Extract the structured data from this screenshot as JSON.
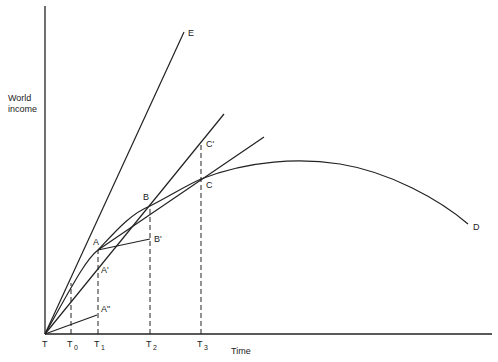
{
  "diagram": {
    "y_axis_label_line1": "World",
    "y_axis_label_line2": "income",
    "x_axis_label": "Time",
    "x_ticks": [
      {
        "name": "T",
        "sub": ""
      },
      {
        "name": "T",
        "sub": "0"
      },
      {
        "name": "T",
        "sub": "1"
      },
      {
        "name": "T",
        "sub": "2"
      },
      {
        "name": "T",
        "sub": "3"
      }
    ],
    "points": {
      "A": "A",
      "A_prime": "A'",
      "A_dprime": "A\"",
      "B": "B",
      "B_prime": "B'",
      "C": "C",
      "C_prime": "C'",
      "D": "D",
      "E": "E"
    },
    "curves": [
      {
        "name": "growth-curve-TABCD",
        "description": "Concave curve from T through A, B, C, peaking after T3 and declining to D"
      },
      {
        "name": "line-TE",
        "description": "Steep straight line from origin T to E"
      },
      {
        "name": "line-TC-prime",
        "description": "Line from origin through A' and C'"
      },
      {
        "name": "line-AC",
        "description": "Line from A through B and C extended"
      },
      {
        "name": "line-AB-prime",
        "description": "Line from A to B'"
      },
      {
        "name": "line-TA-dprime",
        "description": "Short line from origin to A\""
      }
    ],
    "stroke_color": "#222222",
    "background": "#ffffff"
  }
}
